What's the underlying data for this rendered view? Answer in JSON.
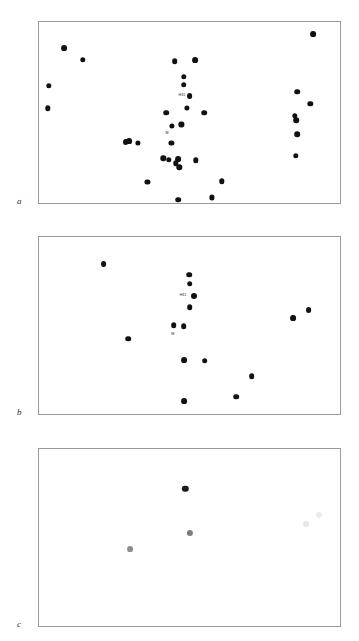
{
  "figure": {
    "width": 359,
    "height": 641,
    "background": "#ffffff",
    "border_color": "#9a9a9a",
    "dot_color": "#111111"
  },
  "panels": [
    {
      "letter": "a",
      "letter_x": 17,
      "letter_y": 197,
      "frame": {
        "x": 38,
        "y": 21,
        "width": 303,
        "height": 183
      }
    },
    {
      "letter": "b",
      "letter_x": 17,
      "letter_y": 408,
      "frame": {
        "x": 38,
        "y": 236,
        "width": 303,
        "height": 179
      }
    },
    {
      "letter": "c",
      "letter_x": 17,
      "letter_y": 620,
      "frame": {
        "x": 38,
        "y": 448,
        "width": 303,
        "height": 179
      }
    }
  ],
  "chart_data": [
    {
      "type": "scatter",
      "panel": "a",
      "title": "",
      "xlabel": "",
      "ylabel": "",
      "grid": false,
      "legend": "none",
      "xlim": [
        0,
        1
      ],
      "ylim": [
        0,
        1
      ],
      "marker_color": "#111111",
      "marker_size_px": 5.4,
      "n_points": 41,
      "points": [
        {
          "x": 0.082,
          "y": 0.858,
          "r": 2.9
        },
        {
          "x": 0.145,
          "y": 0.795,
          "r": 2.7
        },
        {
          "x": 0.033,
          "y": 0.652,
          "r": 2.7
        },
        {
          "x": 0.03,
          "y": 0.528,
          "r": 2.7
        },
        {
          "x": 0.448,
          "y": 0.787,
          "r": 2.8
        },
        {
          "x": 0.477,
          "y": 0.7,
          "r": 2.7
        },
        {
          "x": 0.478,
          "y": 0.658,
          "r": 2.8
        },
        {
          "x": 0.497,
          "y": 0.595,
          "r": 2.9
        },
        {
          "x": 0.487,
          "y": 0.53,
          "r": 2.6
        },
        {
          "x": 0.42,
          "y": 0.505,
          "r": 2.8
        },
        {
          "x": 0.438,
          "y": 0.43,
          "r": 2.6
        },
        {
          "x": 0.47,
          "y": 0.44,
          "r": 2.6
        },
        {
          "x": 0.437,
          "y": 0.34,
          "r": 2.6
        },
        {
          "x": 0.41,
          "y": 0.255,
          "r": 2.7
        },
        {
          "x": 0.428,
          "y": 0.248,
          "r": 2.7
        },
        {
          "x": 0.452,
          "y": 0.228,
          "r": 2.7
        },
        {
          "x": 0.46,
          "y": 0.252,
          "r": 2.9
        },
        {
          "x": 0.463,
          "y": 0.205,
          "r": 2.7
        },
        {
          "x": 0.516,
          "y": 0.79,
          "r": 2.9
        },
        {
          "x": 0.545,
          "y": 0.505,
          "r": 2.8
        },
        {
          "x": 0.518,
          "y": 0.245,
          "r": 2.7
        },
        {
          "x": 0.286,
          "y": 0.345,
          "r": 2.9
        },
        {
          "x": 0.297,
          "y": 0.348,
          "r": 2.9
        },
        {
          "x": 0.327,
          "y": 0.34,
          "r": 2.6
        },
        {
          "x": 0.358,
          "y": 0.125,
          "r": 2.6
        },
        {
          "x": 0.46,
          "y": 0.03,
          "r": 2.8
        },
        {
          "x": 0.603,
          "y": 0.13,
          "r": 2.7
        },
        {
          "x": 0.57,
          "y": 0.042,
          "r": 2.6
        },
        {
          "x": 0.905,
          "y": 0.935,
          "r": 2.9
        },
        {
          "x": 0.852,
          "y": 0.618,
          "r": 2.8
        },
        {
          "x": 0.895,
          "y": 0.553,
          "r": 2.7
        },
        {
          "x": 0.845,
          "y": 0.488,
          "r": 2.7
        },
        {
          "x": 0.848,
          "y": 0.462,
          "r": 2.8
        },
        {
          "x": 0.852,
          "y": 0.388,
          "r": 2.8
        },
        {
          "x": 0.848,
          "y": 0.268,
          "r": 2.7
        }
      ],
      "annotations": [
        {
          "text": "H31",
          "x": 0.483,
          "y": 0.597
        },
        {
          "text": "M",
          "x": 0.428,
          "y": 0.388
        }
      ]
    },
    {
      "type": "scatter",
      "panel": "b",
      "title": "",
      "xlabel": "",
      "ylabel": "",
      "grid": false,
      "legend": "none",
      "xlim": [
        0,
        1
      ],
      "ylim": [
        0,
        1
      ],
      "marker_color": "#111111",
      "marker_size_px": 5.6,
      "n_points": 17,
      "points": [
        {
          "x": 0.213,
          "y": 0.848,
          "r": 2.9
        },
        {
          "x": 0.495,
          "y": 0.79,
          "r": 2.8
        },
        {
          "x": 0.497,
          "y": 0.74,
          "r": 2.8
        },
        {
          "x": 0.513,
          "y": 0.672,
          "r": 3.0
        },
        {
          "x": 0.498,
          "y": 0.608,
          "r": 2.8
        },
        {
          "x": 0.445,
          "y": 0.508,
          "r": 2.8
        },
        {
          "x": 0.478,
          "y": 0.502,
          "r": 2.8
        },
        {
          "x": 0.295,
          "y": 0.432,
          "r": 2.8
        },
        {
          "x": 0.48,
          "y": 0.312,
          "r": 2.9
        },
        {
          "x": 0.547,
          "y": 0.308,
          "r": 2.8
        },
        {
          "x": 0.702,
          "y": 0.222,
          "r": 2.8
        },
        {
          "x": 0.65,
          "y": 0.108,
          "r": 2.8
        },
        {
          "x": 0.478,
          "y": 0.085,
          "r": 2.9
        },
        {
          "x": 0.838,
          "y": 0.548,
          "r": 2.9
        },
        {
          "x": 0.89,
          "y": 0.592,
          "r": 2.9
        }
      ],
      "annotations": [
        {
          "text": "H31",
          "x": 0.487,
          "y": 0.672
        },
        {
          "text": "M",
          "x": 0.447,
          "y": 0.455
        }
      ]
    },
    {
      "type": "scatter",
      "panel": "c",
      "title": "",
      "xlabel": "",
      "ylabel": "",
      "grid": false,
      "legend": "none",
      "xlim": [
        0,
        1
      ],
      "ylim": [
        0,
        1
      ],
      "marker_size_px": 6.2,
      "n_points": 5,
      "points": [
        {
          "x": 0.483,
          "y": 0.778,
          "r": 3.2,
          "color": "#1c1c1c"
        },
        {
          "x": 0.497,
          "y": 0.53,
          "r": 3.1,
          "color": "#7c7c7c"
        },
        {
          "x": 0.3,
          "y": 0.442,
          "r": 2.9,
          "color": "#8e8e8e"
        },
        {
          "x": 0.88,
          "y": 0.58,
          "r": 3.0,
          "color": "#e6e6e6"
        },
        {
          "x": 0.925,
          "y": 0.632,
          "r": 3.0,
          "color": "#ececec"
        }
      ],
      "annotations": []
    }
  ]
}
